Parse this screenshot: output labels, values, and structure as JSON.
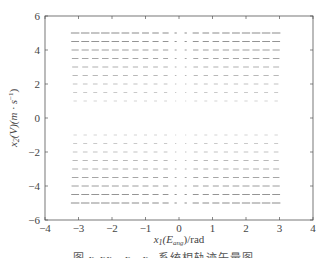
{
  "chart_data": {
    "type": "quiver",
    "title": "",
    "xlabel": "x1(E_ang)/rad",
    "ylabel": "x2(V)(m·s^-1)",
    "xlim": [
      -4,
      4
    ],
    "ylim": [
      -6,
      6
    ],
    "xticks": [
      -4,
      -3,
      -2,
      -1,
      0,
      1,
      2,
      3,
      4
    ],
    "yticks": [
      -6,
      -4,
      -2,
      0,
      2,
      4,
      6
    ],
    "grid": false,
    "legend": null,
    "field": {
      "x_range": [
        -3.1,
        3.1
      ],
      "x_step": 0.3,
      "y_upper": [
        1.0,
        1.5,
        2.0,
        2.5,
        3.0,
        3.5,
        4.0,
        4.5,
        5.0
      ],
      "y_lower": [
        -1.0,
        -1.5,
        -2.0,
        -2.5,
        -3.0,
        -3.5,
        -4.0,
        -4.5,
        -5.0
      ],
      "description": "Horizontal vectors; length grows with |x2|; pointing +x for x2>0 and -x for x2<0; gap near x1=0 and |x2|<1"
    }
  },
  "axis": {
    "x_label_main": "x",
    "x_label_sub": "1",
    "x_label_paren": "(E",
    "x_label_paren_sub": "ang",
    "x_label_tail": ")/rad",
    "y_label_main": "x",
    "y_label_sub": "2",
    "y_label_tail": "(V)(m · s",
    "y_label_sup": "−1",
    "y_label_close": ")"
  },
  "caption": "图 x-xx　x₁–x₂ 系统相轨迹矢量图"
}
